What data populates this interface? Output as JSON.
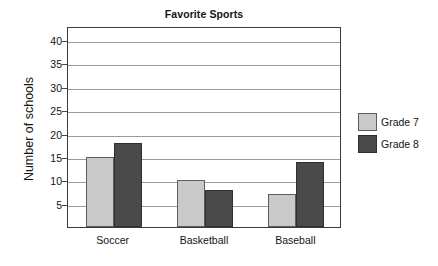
{
  "chart_data": {
    "type": "bar",
    "title": "Favorite Sports",
    "xlabel": "",
    "ylabel": "Number of schools",
    "categories": [
      "Soccer",
      "Basketball",
      "Baseball"
    ],
    "series": [
      {
        "name": "Grade 7",
        "color": "#c9c9c9",
        "values": [
          15,
          10,
          7
        ]
      },
      {
        "name": "Grade 8",
        "color": "#4a4a4a",
        "values": [
          18,
          8,
          14
        ]
      }
    ],
    "yticks": [
      5,
      10,
      15,
      20,
      25,
      30,
      35,
      40
    ],
    "ylim": [
      0,
      43
    ],
    "grid": true,
    "legend_position": "right"
  }
}
